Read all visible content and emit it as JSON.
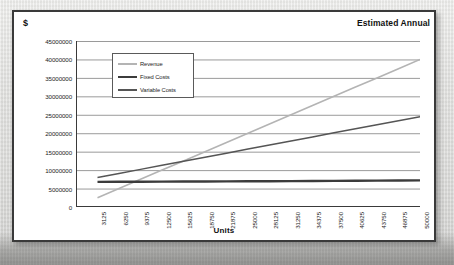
{
  "labels": {
    "currency": "$",
    "title": "Estimated Annual"
  },
  "chart_data": {
    "type": "line",
    "title": "Estimated Annual",
    "xlabel": "Units",
    "ylabel": "$",
    "grid": true,
    "legend_position": "inside-top-left",
    "xlim": [
      0,
      50000
    ],
    "ylim": [
      0,
      45000000
    ],
    "ytick_step": 5000000,
    "ytick_labels": [
      "45000000",
      "40000000",
      "35000000",
      "30000000",
      "25000000",
      "20000000",
      "15000000",
      "10000000",
      "5000000",
      "0"
    ],
    "categories": [
      "3125",
      "6250",
      "9375",
      "12500",
      "15625",
      "18750",
      "21875",
      "25000",
      "28125",
      "31250",
      "34375",
      "37500",
      "40625",
      "43750",
      "46875",
      "50000"
    ],
    "series": [
      {
        "name": "Revenue",
        "color": "#b4b4b4",
        "width": 1.6,
        "values": [
          2500000,
          5000000,
          7500000,
          10000000,
          12500000,
          15000000,
          17500000,
          20000000,
          22500000,
          25000000,
          27500000,
          30000000,
          32500000,
          35000000,
          37500000,
          40000000
        ]
      },
      {
        "name": "Fixed Costs",
        "color": "#3c3c3c",
        "width": 2.4,
        "values": [
          6800000,
          6825000,
          6850000,
          6875000,
          6900000,
          6925000,
          6950000,
          6975000,
          7000000,
          7025000,
          7050000,
          7075000,
          7100000,
          7140000,
          7175000,
          7210000
        ]
      },
      {
        "name": "Variable Costs",
        "color": "#555555",
        "width": 1.5,
        "values": [
          8000000,
          9100000,
          10200000,
          11300000,
          12400000,
          13500000,
          14600000,
          15700000,
          16800000,
          17900000,
          19000000,
          20100000,
          21200000,
          22300000,
          23400000,
          24500000
        ]
      }
    ]
  }
}
